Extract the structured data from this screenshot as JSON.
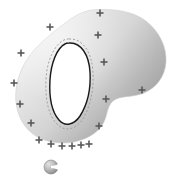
{
  "figure": {
    "title": "",
    "background_color": "#ffffff",
    "width": 182,
    "height": 181,
    "blob": {
      "name": "amorphous-grey-region",
      "fill_start_color": "#efefef",
      "fill_mid_color": "#d8d8d8",
      "fill_end_color": "#9a9a9a",
      "edge_color": "#c9c9c9",
      "path": "M 92 10 C 112 8 133 11 146 21 C 160 32 167 48 166 62 C 165 77 156 88 144 93 C 132 98 120 95 113 101 C 106 107 108 118 101 127 C 93 137 78 143 63 143 C 47 143 33 137 25 126 C 16 114 14 98 17 84 C 20 69 28 56 37 47 C 47 37 58 28 68 21 C 76 15 84 11 92 10 Z"
    },
    "inner_ellipse": {
      "name": "white-inner-ellipse",
      "fill_color": "#ffffff",
      "stroke_color": "#1a1a1a",
      "stroke_width": 1.4,
      "path": "M 69 43 C 81 42 89 55 90 72 C 91 89 87 105 80 116 C 74 125 65 127 59 120 C 52 112 49 97 50 80 C 51 63 57 48 65 44 C 66 43 68 43 69 43 Z"
    },
    "dashed_contour": {
      "name": "dashed-offset-contour",
      "stroke_color": "#999999",
      "stroke_width": 0.9,
      "dash_pattern": "2 2",
      "path": "M 69 39 C 83 38 92 53 93 72 C 94 91 90 108 82 120 C 75 130 64 132 57 124 C 48 115 45 98 46 79 C 47 60 55 44 64 40 C 66 39 67 39 69 39 Z"
    },
    "plus_markers": {
      "name": "plus-marker-set",
      "color": "#595959",
      "size": 7,
      "stroke_width": 1.6,
      "count": 17,
      "points": [
        {
          "x": 100,
          "y": 13
        },
        {
          "x": 50,
          "y": 27
        },
        {
          "x": 21,
          "y": 53
        },
        {
          "x": 14,
          "y": 83
        },
        {
          "x": 20,
          "y": 104
        },
        {
          "x": 31,
          "y": 123
        },
        {
          "x": 39,
          "y": 140
        },
        {
          "x": 51,
          "y": 144
        },
        {
          "x": 62,
          "y": 146
        },
        {
          "x": 72,
          "y": 146
        },
        {
          "x": 81,
          "y": 145
        },
        {
          "x": 89,
          "y": 144
        },
        {
          "x": 99,
          "y": 126
        },
        {
          "x": 106,
          "y": 99
        },
        {
          "x": 142,
          "y": 90
        },
        {
          "x": 104,
          "y": 62
        },
        {
          "x": 98,
          "y": 35
        }
      ]
    },
    "sphere_icon": {
      "name": "grey-sphere-marker",
      "center_x": 51,
      "center_y": 167,
      "radius": 7,
      "fill_light_color": "#cfcfcf",
      "fill_dark_color": "#8a8a8a",
      "notch_color": "#ffffff",
      "label": "sphere"
    }
  }
}
